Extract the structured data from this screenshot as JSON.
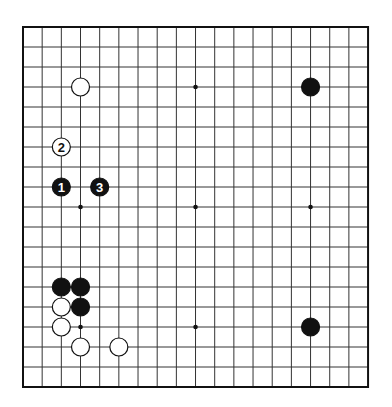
{
  "board": {
    "size": 19,
    "origin_x": 23,
    "origin_y": 27,
    "spacing_x": 19.17,
    "spacing_y": 20,
    "line_color": "#333333",
    "border_color": "#111111",
    "background": "#ffffff",
    "star_points": [
      [
        3,
        9
      ],
      [
        9,
        3
      ],
      [
        9,
        9
      ],
      [
        15,
        9
      ],
      [
        3,
        15
      ],
      [
        9,
        15
      ],
      [
        3,
        3
      ],
      [
        15,
        3
      ],
      [
        15,
        15
      ]
    ],
    "stones": [
      {
        "color": "white",
        "col": 3,
        "row": 3,
        "label": ""
      },
      {
        "color": "black",
        "col": 15,
        "row": 3,
        "label": ""
      },
      {
        "color": "white",
        "col": 2,
        "row": 6,
        "label": "2"
      },
      {
        "color": "black",
        "col": 2,
        "row": 8,
        "label": "1"
      },
      {
        "color": "black",
        "col": 4,
        "row": 8,
        "label": "3"
      },
      {
        "color": "black",
        "col": 2,
        "row": 13,
        "label": ""
      },
      {
        "color": "black",
        "col": 3,
        "row": 13,
        "label": ""
      },
      {
        "color": "white",
        "col": 2,
        "row": 14,
        "label": ""
      },
      {
        "color": "black",
        "col": 3,
        "row": 14,
        "label": ""
      },
      {
        "color": "white",
        "col": 2,
        "row": 15,
        "label": ""
      },
      {
        "color": "black",
        "col": 15,
        "row": 15,
        "label": ""
      },
      {
        "color": "white",
        "col": 3,
        "row": 16,
        "label": ""
      },
      {
        "color": "white",
        "col": 5,
        "row": 16,
        "label": ""
      }
    ]
  }
}
